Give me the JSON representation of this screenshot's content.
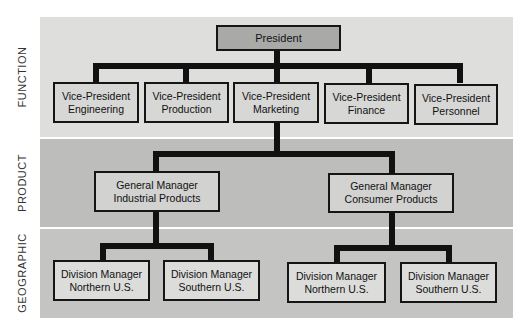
{
  "bands": {
    "function": "FUNCTION",
    "product": "PRODUCT",
    "geographic": "GEOGRAPHIC"
  },
  "president": {
    "title": "President"
  },
  "vice_presidents": [
    {
      "title": "Vice-President",
      "area": "Engineering"
    },
    {
      "title": "Vice-President",
      "area": "Production"
    },
    {
      "title": "Vice-President",
      "area": "Marketing"
    },
    {
      "title": "Vice-President",
      "area": "Finance"
    },
    {
      "title": "Vice-President",
      "area": "Personnel"
    }
  ],
  "general_managers": [
    {
      "title": "General Manager",
      "area": "Industrial Products"
    },
    {
      "title": "General Manager",
      "area": "Consumer Products"
    }
  ],
  "division_managers": [
    {
      "title": "Division Manager",
      "area": "Northern U.S."
    },
    {
      "title": "Division Manager",
      "area": "Southern U.S."
    },
    {
      "title": "Division Manager",
      "area": "Northern U.S."
    },
    {
      "title": "Division Manager",
      "area": "Southern U.S."
    }
  ],
  "colors": {
    "function_band": "#dededd",
    "product_band": "#bdbdbc",
    "geographic_band": "#c4c4c3",
    "president_box": "#a9a9a8",
    "connector": "#111111"
  }
}
